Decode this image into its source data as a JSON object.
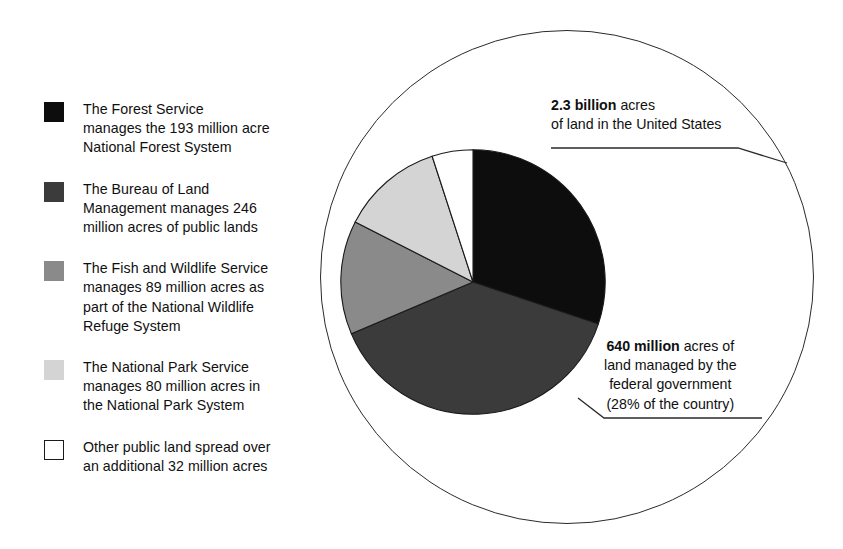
{
  "legend": {
    "items": [
      {
        "swatch": "black",
        "swatch_color": "#0d0d0d",
        "label": "The Forest Service manages the 193 million acre National Forest System",
        "lines": [
          "The Forest Service",
          "manages the 193 million acre",
          "National Forest System"
        ]
      },
      {
        "swatch": "dark-gray",
        "swatch_color": "#3b3b3b",
        "label": "The Bureau of Land Management manages 246 million acres of public lands",
        "lines": [
          "The Bureau of Land",
          "Management manages 246",
          "million acres of public lands"
        ]
      },
      {
        "swatch": "medium-gray",
        "swatch_color": "#8a8a8a",
        "label": "The Fish and Wildlife Service manages 89 million acres as part of the National Wildlife Refuge System",
        "lines": [
          "The Fish and Wildlife Service",
          "manages 89 million acres as",
          "part of the National Wildlife",
          "Refuge System"
        ]
      },
      {
        "swatch": "light-gray",
        "swatch_color": "#d4d4d4",
        "label": "The National Park Service manages 80 million acres in the National Park System",
        "lines": [
          "The National Park Service",
          "manages 80 million acres in",
          "the National Park System"
        ]
      },
      {
        "swatch": "white",
        "swatch_color": "#ffffff",
        "label": "Other public land spread over an additional 32 million acres",
        "lines": [
          "Other public land spread over",
          "an additional 32 million acres"
        ]
      }
    ]
  },
  "callouts": {
    "total_land": {
      "bold": "2.3 billion",
      "rest": " acres",
      "line2": "of land in the United States"
    },
    "federal_land": {
      "bold": "640 million",
      "rest": " acres of",
      "line2": "land managed by the",
      "line3": "federal government",
      "line4": "(28% of the country)"
    }
  },
  "chart_data": {
    "type": "pie",
    "unit": "million acres",
    "total_federal_acres_millions": 640,
    "total_us_acres_billions": 2.3,
    "federal_share_of_country_percent": 28,
    "categories": [
      "Forest Service — National Forest System",
      "Bureau of Land Management — public lands",
      "Fish and Wildlife Service — National Wildlife Refuge System",
      "National Park Service — National Park System",
      "Other public land"
    ],
    "values": [
      193,
      246,
      89,
      80,
      32
    ],
    "percentages": [
      30.2,
      38.4,
      13.9,
      12.5,
      5.0
    ],
    "colors": [
      "#0d0d0d",
      "#3b3b3b",
      "#8a8a8a",
      "#d4d4d4",
      "#ffffff"
    ],
    "start_angle_deg": 0,
    "direction": "clockwise",
    "legend_position": "left",
    "grid": false
  }
}
